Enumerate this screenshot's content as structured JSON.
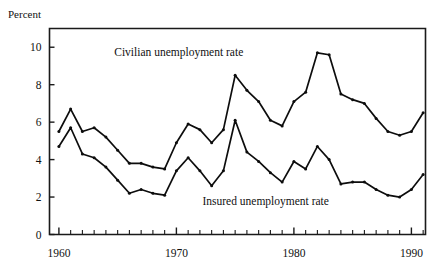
{
  "figure": {
    "axis_title": "Percent"
  },
  "chart_data": {
    "type": "line",
    "title": "",
    "subtitle": "",
    "xlabel": "",
    "ylabel": "Percent",
    "xlim": [
      1959.2,
      1991.2
    ],
    "ylim": [
      0,
      11
    ],
    "grid": false,
    "legend_position": "inline-annotation",
    "yticks": [
      0,
      2,
      4,
      6,
      8,
      10
    ],
    "ytick_labels": [
      "0",
      "2",
      "4",
      "6",
      "8",
      "10"
    ],
    "xticks": [
      1960,
      1970,
      1980,
      1990
    ],
    "xtick_labels": [
      "1960",
      "1970",
      "1980",
      "1990"
    ],
    "x_minor_tick_interval": 1,
    "x": [
      1960,
      1961,
      1962,
      1963,
      1964,
      1965,
      1966,
      1967,
      1968,
      1969,
      1970,
      1971,
      1972,
      1973,
      1974,
      1975,
      1976,
      1977,
      1978,
      1979,
      1980,
      1981,
      1982,
      1983,
      1984,
      1985,
      1986,
      1987,
      1988,
      1989,
      1990,
      1991
    ],
    "series": [
      {
        "name": "Civilian unemployment rate",
        "annotation": "Civilian  unemployment  rate",
        "color": "#0d0d0d",
        "values": [
          5.5,
          6.7,
          5.5,
          5.7,
          5.2,
          4.5,
          3.8,
          3.8,
          3.6,
          3.5,
          4.9,
          5.9,
          5.6,
          4.9,
          5.6,
          8.5,
          7.7,
          7.1,
          6.1,
          5.8,
          7.1,
          7.6,
          9.7,
          9.6,
          7.5,
          7.2,
          7.0,
          6.2,
          5.5,
          5.3,
          5.5,
          6.5
        ]
      },
      {
        "name": "Insured unemployment rate",
        "annotation": "Insured  unemployment  rate",
        "color": "#0d0d0d",
        "values": [
          4.7,
          5.7,
          4.3,
          4.1,
          3.6,
          2.9,
          2.2,
          2.4,
          2.2,
          2.1,
          3.4,
          4.1,
          3.4,
          2.6,
          3.4,
          6.1,
          4.4,
          3.9,
          3.3,
          2.8,
          3.9,
          3.5,
          4.7,
          4.0,
          2.7,
          2.8,
          2.8,
          2.4,
          2.1,
          2.0,
          2.4,
          3.2
        ]
      }
    ],
    "annotations": [
      {
        "text": "Civilian  unemployment  rate",
        "x": 1970.2,
        "y": 9.55,
        "anchor": "middle"
      },
      {
        "text": "Insured  unemployment  rate",
        "x": 1977.6,
        "y": 1.55,
        "anchor": "middle"
      }
    ]
  }
}
